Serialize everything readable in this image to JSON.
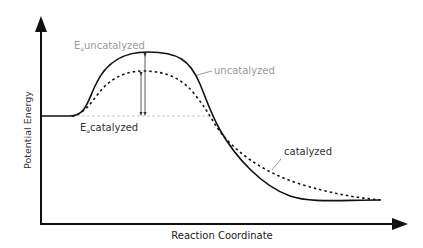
{
  "diagram": {
    "x_axis_label": "Reaction Coordinate",
    "y_axis_label": "Potential Energy",
    "labels": {
      "ea_uncatalyzed_E": "E",
      "ea_uncatalyzed_sub": "a",
      "ea_uncatalyzed_text": "uncatalyzed",
      "ea_catalyzed_E": "E",
      "ea_catalyzed_sub": "a",
      "ea_catalyzed_text": "catalyzed",
      "curve_uncatalyzed": "uncatalyzed",
      "curve_catalyzed": "catalyzed"
    },
    "colors": {
      "axis": "#111111",
      "curve": "#111111",
      "label_grey": "#9a9a9a",
      "label_dark": "#333333",
      "baseline_dash": "#c8c8c8"
    }
  }
}
